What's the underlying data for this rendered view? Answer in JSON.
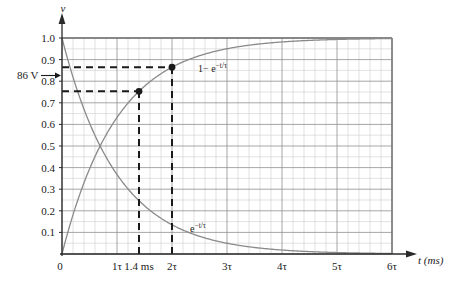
{
  "chart_data": {
    "type": "line",
    "title": "",
    "xlabel": "t (ms)",
    "ylabel": "v",
    "xlim": [
      0,
      6
    ],
    "ylim": [
      0,
      1.05
    ],
    "grid": true,
    "legend_position": "inline-curve-labels",
    "x_tick_labels": [
      "0",
      "1τ",
      "2τ",
      "3τ",
      "4τ",
      "5τ",
      "6τ"
    ],
    "x_tick_values": [
      0,
      1,
      2,
      3,
      4,
      5,
      6
    ],
    "y_tick_labels": [
      "0.1",
      "0.2",
      "0.3",
      "0.4",
      "0.5",
      "0.6",
      "0.7",
      "0.8",
      "0.9",
      "1.0"
    ],
    "y_tick_values": [
      0.1,
      0.2,
      0.3,
      0.4,
      0.5,
      0.6,
      0.7,
      0.8,
      0.9,
      1.0
    ],
    "origin_label": "0",
    "special_x_tick": {
      "label": "1.4 ms",
      "value": 1.4
    },
    "series": [
      {
        "name": "1−e⁻ᵗᐟτ",
        "label_parts": {
          "base": "1− e",
          "exponent": "−t/τ"
        },
        "formula": "v = 1 - exp(-t/tau)",
        "x": [
          0,
          0.1,
          0.2,
          0.3,
          0.4,
          0.5,
          0.6,
          0.7,
          0.8,
          0.9,
          1.0,
          1.2,
          1.4,
          1.6,
          1.8,
          2.0,
          2.5,
          3.0,
          3.5,
          4.0,
          4.5,
          5.0,
          5.5,
          6.0
        ],
        "y": [
          0,
          0.095,
          0.181,
          0.259,
          0.33,
          0.393,
          0.451,
          0.503,
          0.551,
          0.593,
          0.632,
          0.699,
          0.753,
          0.798,
          0.835,
          0.865,
          0.918,
          0.95,
          0.97,
          0.982,
          0.989,
          0.993,
          0.996,
          0.998
        ]
      },
      {
        "name": "e⁻ᵗᐟτ",
        "label_parts": {
          "base": "e",
          "exponent": "−t/τ"
        },
        "formula": "v = exp(-t/tau)",
        "x": [
          0,
          0.1,
          0.2,
          0.3,
          0.4,
          0.5,
          0.6,
          0.7,
          0.8,
          0.9,
          1.0,
          1.2,
          1.4,
          1.6,
          1.8,
          2.0,
          2.5,
          3.0,
          3.5,
          4.0,
          4.5,
          5.0,
          5.5,
          6.0
        ],
        "y": [
          1.0,
          0.905,
          0.819,
          0.741,
          0.67,
          0.607,
          0.549,
          0.497,
          0.449,
          0.407,
          0.368,
          0.301,
          0.247,
          0.202,
          0.165,
          0.135,
          0.082,
          0.05,
          0.03,
          0.018,
          0.011,
          0.0067,
          0.0041,
          0.0025
        ]
      }
    ],
    "markers": [
      {
        "x": 1.4,
        "y": 0.753,
        "curve": "1−e⁻ᵗᐟτ"
      },
      {
        "x": 2.0,
        "y": 0.865,
        "curve": "1−e⁻ᵗᐟτ"
      }
    ],
    "annotations": [
      {
        "name": "voltage-annotation",
        "text": "86 V",
        "y_value": 0.865,
        "type": "arrow-to-axis"
      }
    ],
    "guide_lines": [
      {
        "type": "horizontal",
        "y": 0.865,
        "from_x": 0,
        "to_x": 2.0,
        "style": "dashed"
      },
      {
        "type": "horizontal",
        "y": 0.753,
        "from_x": 0,
        "to_x": 1.4,
        "style": "dashed"
      },
      {
        "type": "vertical",
        "x": 1.4,
        "from_y": 0,
        "to_y": 0.753,
        "style": "dashed"
      },
      {
        "type": "vertical",
        "x": 2.0,
        "from_y": 0,
        "to_y": 0.865,
        "style": "dashed"
      }
    ]
  },
  "colors": {
    "curve": "#8a8a8a",
    "grid_minor": "#cfcfcf",
    "grid_major": "#8f8f8f",
    "axis": "#2a2a2a",
    "dashed": "#1a1a1a",
    "marker": "#1a1a1a",
    "text": "#1a1a1a",
    "background": "#ffffff"
  }
}
